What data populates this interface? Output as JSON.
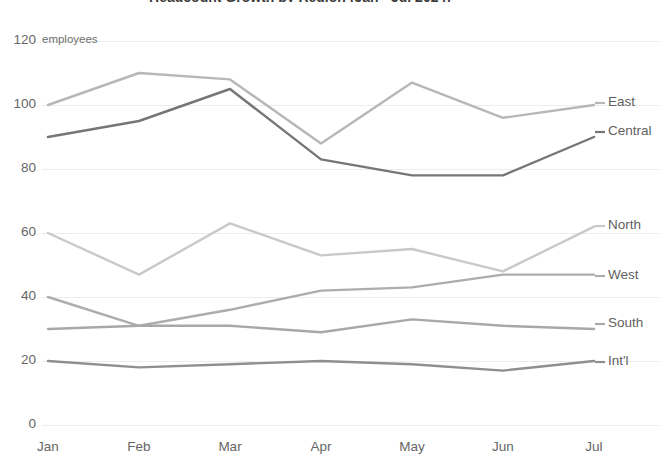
{
  "chart_data": {
    "type": "line",
    "title": "Headcount Growth by Region (Jan - Jul 2024)",
    "xlabel": "",
    "ylabel": "employees",
    "unit_label": "employees",
    "categories": [
      "Jan",
      "Feb",
      "Mar",
      "Apr",
      "May",
      "Jun",
      "Jul"
    ],
    "yticks": [
      0,
      20,
      40,
      60,
      80,
      100,
      120
    ],
    "ylim": [
      0,
      120
    ],
    "grid": "horizontal",
    "legend_position": "right-of-plot-inline",
    "series": [
      {
        "name": "East",
        "color": "#b7b7b7",
        "values": [
          100,
          110,
          108,
          88,
          107,
          96,
          100
        ]
      },
      {
        "name": "Central",
        "color": "#767676",
        "values": [
          90,
          95,
          105,
          83,
          78,
          78,
          90
        ]
      },
      {
        "name": "North",
        "color": "#c9c9c9",
        "values": [
          60,
          47,
          63,
          53,
          55,
          48,
          62
        ]
      },
      {
        "name": "West",
        "color": "#adadad",
        "values": [
          40,
          31,
          36,
          42,
          43,
          47,
          47
        ]
      },
      {
        "name": "South",
        "color": "#a8a8a8",
        "values": [
          30,
          31,
          31,
          29,
          33,
          31,
          30
        ]
      },
      {
        "name": "Int'l",
        "color": "#8f8f8f",
        "values": [
          20,
          18,
          19,
          20,
          19,
          17,
          20
        ]
      }
    ]
  },
  "style": {
    "grid_color": "#ededed",
    "axis_text_color": "#666666",
    "background": "#ffffff"
  }
}
